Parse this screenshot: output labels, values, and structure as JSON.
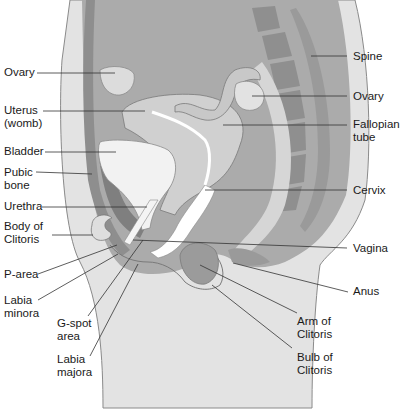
{
  "diagram": {
    "colors": {
      "background": "#ffffff",
      "body_light": "#e6e6e6",
      "body_mid": "#bdbdbd",
      "abdomen_fill": "#a9a9a9",
      "dark_tissue": "#8c8c8c",
      "organ_light": "#d9d9d9",
      "highlight": "#ffffff",
      "line": "#333333"
    },
    "labels": {
      "left": [
        {
          "id": "ovary-left",
          "text": "Ovary"
        },
        {
          "id": "uterus",
          "text": "Uterus\n(womb)"
        },
        {
          "id": "bladder",
          "text": "Bladder"
        },
        {
          "id": "pubic-bone",
          "text": "Pubic\nbone"
        },
        {
          "id": "urethra",
          "text": "Urethra"
        },
        {
          "id": "body-of-clitoris",
          "text": "Body of\nClitoris"
        },
        {
          "id": "p-area",
          "text": "P-area"
        },
        {
          "id": "labia-minora",
          "text": "Labia\nminora"
        },
        {
          "id": "g-spot-area",
          "text": "G-spot\narea"
        },
        {
          "id": "labia-majora",
          "text": "Labia\nmajora"
        }
      ],
      "right": [
        {
          "id": "spine",
          "text": "Spine"
        },
        {
          "id": "ovary-right",
          "text": "Ovary"
        },
        {
          "id": "fallopian-tube",
          "text": "Fallopian\ntube"
        },
        {
          "id": "cervix",
          "text": "Cervix"
        },
        {
          "id": "vagina",
          "text": "Vagina"
        },
        {
          "id": "anus",
          "text": "Anus"
        },
        {
          "id": "arm-of-clitoris",
          "text": "Arm of\nClitoris"
        },
        {
          "id": "bulb-of-clitoris",
          "text": "Bulb of\nClitoris"
        }
      ]
    }
  }
}
